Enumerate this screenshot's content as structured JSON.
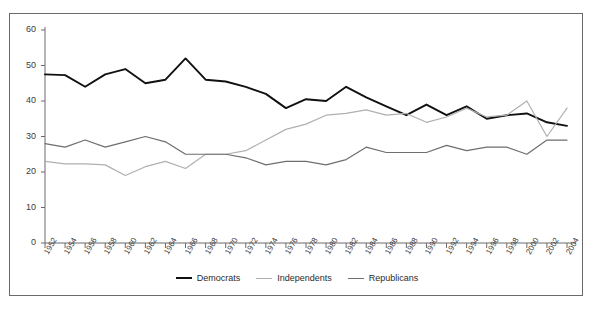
{
  "chart_data": {
    "type": "line",
    "title": "",
    "xlabel": "",
    "ylabel": "",
    "ylim": [
      0,
      60
    ],
    "ytick_values": [
      0,
      10,
      20,
      30,
      40,
      50,
      60
    ],
    "ytick_labels": [
      "0",
      "10",
      "20",
      "30",
      "40",
      "50",
      "60"
    ],
    "grid": false,
    "legend_position": "bottom-center",
    "categories": [
      "1952",
      "1954",
      "1956",
      "1958",
      "1960",
      "1962",
      "1964",
      "1966",
      "1968",
      "1970",
      "1972",
      "1974",
      "1976",
      "1978",
      "1980",
      "1982",
      "1984",
      "1986",
      "1988",
      "1990",
      "1992",
      "1994",
      "1996",
      "1998",
      "2000",
      "2002",
      "2004"
    ],
    "series": [
      {
        "name": "Democrats",
        "color": "#111111",
        "values": [
          47.5,
          47.3,
          44.0,
          47.5,
          49.0,
          45.0,
          46.0,
          52.0,
          46.0,
          45.5,
          44.0,
          42.0,
          38.0,
          40.5,
          40.0,
          44.0,
          41.0,
          38.5,
          36.0,
          39.0,
          36.0,
          38.5,
          35.0,
          36.0,
          36.5,
          34.0,
          33.0
        ]
      },
      {
        "name": "Independents",
        "color": "#b0b0b0",
        "values": [
          23.0,
          22.3,
          22.3,
          22.0,
          19.0,
          21.5,
          23.0,
          21.0,
          25.0,
          25.0,
          26.0,
          29.0,
          32.0,
          33.5,
          36.0,
          36.5,
          37.5,
          36.0,
          36.5,
          34.0,
          35.5,
          38.0,
          35.5,
          36.0,
          40.0,
          30.0,
          38.0
        ]
      },
      {
        "name": "Republicans",
        "color": "#6e6e6e",
        "values": [
          28.0,
          27.0,
          29.0,
          27.0,
          28.5,
          30.0,
          28.5,
          25.0,
          25.0,
          25.0,
          24.0,
          22.0,
          23.0,
          23.0,
          22.0,
          23.5,
          27.0,
          25.5,
          25.5,
          25.5,
          27.5,
          26.0,
          27.0,
          27.0,
          25.0,
          29.0,
          29.0
        ]
      }
    ]
  },
  "legend": {
    "items": [
      {
        "label": "Democrats",
        "color": "#111111"
      },
      {
        "label": "Independents",
        "color": "#b0b0b0"
      },
      {
        "label": "Republicans",
        "color": "#6e6e6e"
      }
    ]
  },
  "axes": {
    "axis_color": "#6a6a6a",
    "tick_color": "#6a6a6a",
    "label_color": "#3b3b3b"
  }
}
